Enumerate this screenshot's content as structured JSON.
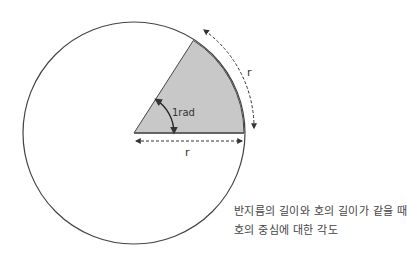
{
  "diagram": {
    "labels": {
      "angle": "1rad",
      "arc_length": "r",
      "radius": "r"
    },
    "caption": {
      "line1": "반지름의 길이와 호의 길이가 같을 때",
      "line2": "호의 중심에 대한 각도"
    },
    "colors": {
      "sector_fill": "#c8c8c8",
      "stroke": "#333333"
    }
  }
}
